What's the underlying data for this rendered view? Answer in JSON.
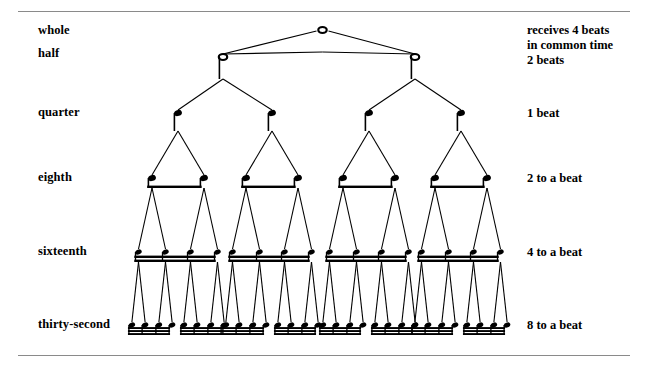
{
  "figure": {
    "background": "#ffffff",
    "ink": "#000000",
    "rule_color": "#8a8a8a"
  },
  "rows": [
    {
      "id": "whole",
      "left_label": "whole",
      "right_label": "receives 4 beats",
      "note_count": 1,
      "y": 30
    },
    {
      "id": "half",
      "left_label": "half",
      "right_label": "2 beats",
      "note_count": 2,
      "y": 57
    },
    {
      "id": "quarter",
      "left_label": "quarter",
      "right_label": "1 beat",
      "note_count": 4,
      "y": 113
    },
    {
      "id": "eighth",
      "left_label": "eighth",
      "right_label": "2 to a beat",
      "note_count": 8,
      "y": 178
    },
    {
      "id": "sixteenth",
      "left_label": "sixteenth",
      "right_label": "4 to a beat",
      "note_count": 16,
      "y": 252
    },
    {
      "id": "thirty-second",
      "left_label": "thirty-second",
      "right_label": "8 to a beat",
      "note_count": 32,
      "y": 325
    }
  ],
  "right_notes": {
    "whole_line_1": "receives 4 beats",
    "whole_line_2": "in common time",
    "half_line": "2 beats",
    "quarter_line": "1 beat",
    "eighth_line": "2 to a beat",
    "sixteenth_line": "4 to a beat",
    "thirty_second_line": "8 to a beat"
  },
  "left_labels": {
    "whole": "whole",
    "half": "half",
    "quarter": "quarter",
    "eighth": "eighth",
    "sixteenth": "sixteenth",
    "thirty_second": "thirty-second"
  },
  "chart_data": {
    "type": "diagram",
    "structure": "binary subdivision tree",
    "levels": [
      {
        "name": "whole",
        "count": 1,
        "beats": 4,
        "beam_count": 0,
        "notehead": "open"
      },
      {
        "name": "half",
        "count": 2,
        "beats": 2,
        "beam_count": 0,
        "notehead": "open"
      },
      {
        "name": "quarter",
        "count": 4,
        "beats": 1,
        "beam_count": 0,
        "notehead": "filled"
      },
      {
        "name": "eighth",
        "count": 8,
        "beats": 0.5,
        "beam_count": 1,
        "notehead": "filled"
      },
      {
        "name": "sixteenth",
        "count": 16,
        "beats": 0.25,
        "beam_count": 2,
        "notehead": "filled"
      },
      {
        "name": "thirty-second",
        "count": 32,
        "beats": 0.125,
        "beam_count": 3,
        "notehead": "filled"
      }
    ]
  }
}
